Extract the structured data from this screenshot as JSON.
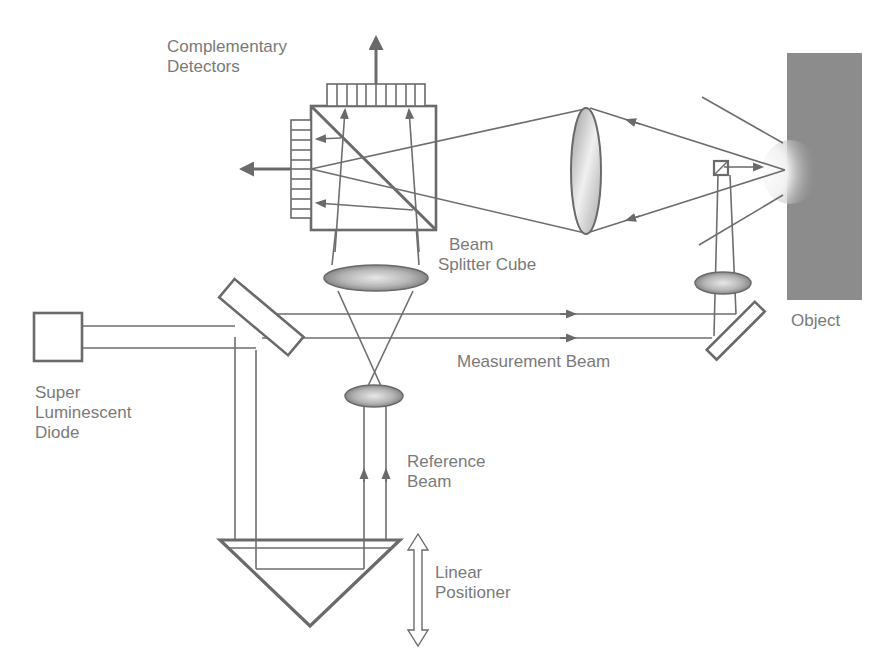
{
  "diagram": {
    "labels": {
      "complementary_detectors": [
        "Complementary",
        "Detectors"
      ],
      "beam_splitter_cube": [
        "Beam",
        "Splitter Cube"
      ],
      "object": "Object",
      "measurement_beam": "Measurement Beam",
      "super_luminescent_diode": [
        "Super",
        "Luminescent",
        "Diode"
      ],
      "reference_beam": [
        "Reference",
        "Beam"
      ],
      "linear_positioner": [
        "Linear",
        "Positioner"
      ]
    },
    "components": [
      "super-luminescent-diode",
      "beam-splitter-plate",
      "beam-splitter-cube",
      "detector-array-top",
      "detector-array-left",
      "collection-lens",
      "focusing-lens-measurement",
      "fold-mirror",
      "micro-prism",
      "object",
      "imaging-lens-cube",
      "reference-lens",
      "corner-cube-retroreflector",
      "linear-positioner-arrow"
    ],
    "colors": {
      "line": "#6e6e6e",
      "text": "#7a7a7a",
      "object_fill": "#8c8c8c",
      "background": "#ffffff"
    }
  }
}
